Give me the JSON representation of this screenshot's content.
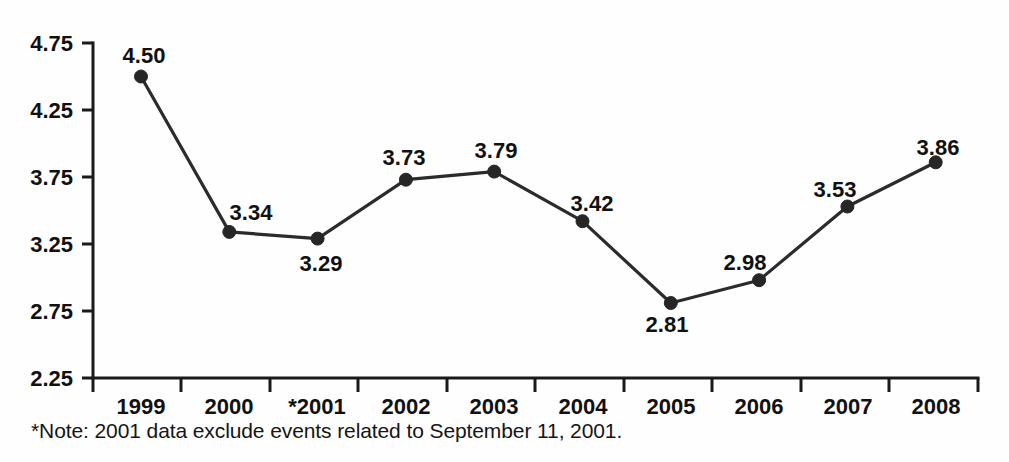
{
  "chart_data": {
    "type": "line",
    "title": "",
    "subtitle": "",
    "xlabel": "",
    "ylabel": "",
    "categories": [
      "1999",
      "2000",
      "*2001",
      "2002",
      "2003",
      "2004",
      "2005",
      "2006",
      "2007",
      "2008"
    ],
    "values": [
      4.5,
      3.34,
      3.29,
      3.73,
      3.79,
      3.42,
      2.81,
      2.98,
      3.53,
      3.86
    ],
    "point_labels": [
      "4.50",
      "3.34",
      "3.29",
      "3.73",
      "3.79",
      "3.42",
      "2.81",
      "2.98",
      "3.53",
      "3.86"
    ],
    "label_positions": [
      "above",
      "above-right",
      "below-right",
      "above",
      "above",
      "above-right",
      "below",
      "above-left",
      "above-left",
      "above"
    ],
    "ylim": [
      2.25,
      4.75
    ],
    "yticks": [
      4.75,
      4.25,
      3.75,
      3.25,
      2.75,
      2.25
    ],
    "ytick_labels": [
      "4.75",
      "4.25",
      "3.75",
      "3.25",
      "2.75",
      "2.25"
    ],
    "xtick_labels": [
      "1999",
      "2000",
      "*2001",
      "2002",
      "2003",
      "2004",
      "2005",
      "2006",
      "2007",
      "2008"
    ],
    "grid": false,
    "legend": "none",
    "series": [
      {
        "name": "rate",
        "values": [
          4.5,
          3.34,
          3.29,
          3.73,
          3.79,
          3.42,
          2.81,
          2.98,
          3.53,
          3.86
        ]
      }
    ],
    "annotations": [
      "*Note: 2001 data exclude events related to September 11, 2001."
    ],
    "colors": {
      "line": "#2b2b2b",
      "marker": "#262626",
      "axis": "#1a1a1a",
      "background": "#ffffff",
      "text": "#111111"
    }
  },
  "footnote": {
    "text": "*Note: 2001 data exclude events related to September 11, 2001."
  },
  "axis": {
    "y_labels": [
      "4.75",
      "4.25",
      "3.75",
      "3.25",
      "2.75",
      "2.25"
    ],
    "x_labels": [
      "1999",
      "2000",
      "*2001",
      "2002",
      "2003",
      "2004",
      "2005",
      "2006",
      "2007",
      "2008"
    ]
  },
  "data_labels": [
    "4.50",
    "3.34",
    "3.29",
    "3.73",
    "3.79",
    "3.42",
    "2.81",
    "2.98",
    "3.53",
    "3.86"
  ]
}
